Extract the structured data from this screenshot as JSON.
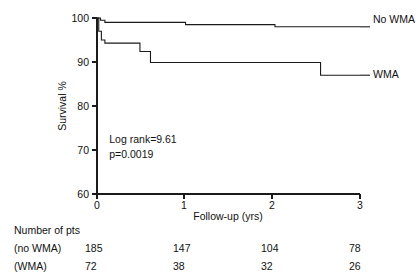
{
  "chart_data": {
    "type": "line",
    "title": "",
    "subtitle": "",
    "xlabel": "Follow-up (yrs)",
    "ylabel": "Survival %",
    "xlim": [
      0,
      3
    ],
    "ylim": [
      60,
      100
    ],
    "xticks": [
      0,
      1,
      2,
      3
    ],
    "xtick_labels": [
      "0",
      "1",
      "2",
      "3"
    ],
    "yticks": [
      60,
      70,
      80,
      90,
      100
    ],
    "ytick_labels": [
      "60",
      "70",
      "80",
      "90",
      "100"
    ],
    "grid": false,
    "legend_position": "right-inline",
    "series": [
      {
        "name": "No WMA",
        "label": "No WMA",
        "color": "#1a1a1a",
        "step": "post",
        "points": [
          {
            "x": 0.0,
            "y": 100.0
          },
          {
            "x": 0.04,
            "y": 99.5
          },
          {
            "x": 0.09,
            "y": 99.0
          },
          {
            "x": 1.01,
            "y": 98.5
          },
          {
            "x": 2.03,
            "y": 98.0
          },
          {
            "x": 3.0,
            "y": 98.0
          }
        ]
      },
      {
        "name": "WMA",
        "label": "WMA",
        "color": "#1a1a1a",
        "step": "post",
        "points": [
          {
            "x": 0.0,
            "y": 100.0
          },
          {
            "x": 0.02,
            "y": 97.0
          },
          {
            "x": 0.05,
            "y": 95.0
          },
          {
            "x": 0.09,
            "y": 94.3
          },
          {
            "x": 0.49,
            "y": 92.4
          },
          {
            "x": 0.61,
            "y": 89.9
          },
          {
            "x": 2.55,
            "y": 87.0
          },
          {
            "x": 3.0,
            "y": 87.0
          }
        ]
      }
    ],
    "annotations": [
      {
        "name": "log-rank",
        "text": "Log rank=9.61",
        "x": 0.14,
        "y": 71.5
      },
      {
        "name": "p-value",
        "text": "p=0.0019",
        "x": 0.14,
        "y": 68.2
      }
    ]
  },
  "risk_table": {
    "heading": "Number of pts",
    "time_points": [
      "0",
      "1",
      "2",
      "3"
    ],
    "rows": [
      {
        "label": "(no WMA)",
        "values": [
          "185",
          "147",
          "104",
          "78"
        ]
      },
      {
        "label": "(WMA)",
        "values": [
          "72",
          "38",
          "32",
          "26"
        ]
      }
    ]
  },
  "colors": {
    "axis": "#1a1a1a",
    "curve": "#1a1a1a",
    "background": "#ffffff",
    "text": "#111111"
  }
}
